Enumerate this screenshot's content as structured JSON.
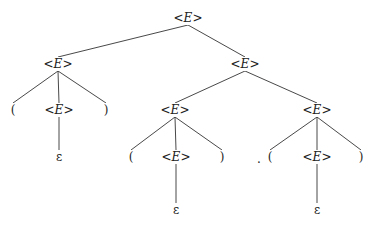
{
  "diagram": {
    "type": "parse-tree",
    "nodes": [
      {
        "id": "n0",
        "label": "<E>",
        "x": 188,
        "y": 18
      },
      {
        "id": "n1",
        "label": "<E>",
        "x": 58,
        "y": 64
      },
      {
        "id": "n2",
        "label": "<E>",
        "x": 245,
        "y": 64
      },
      {
        "id": "n3",
        "label": "(",
        "x": 13,
        "y": 110
      },
      {
        "id": "n4",
        "label": "<E>",
        "x": 59,
        "y": 110
      },
      {
        "id": "n5",
        "label": ")",
        "x": 106,
        "y": 110
      },
      {
        "id": "n6",
        "label": "ε",
        "x": 59,
        "y": 157
      },
      {
        "id": "n7",
        "label": "<E>",
        "x": 175,
        "y": 110
      },
      {
        "id": "n8",
        "label": "<E>",
        "x": 317,
        "y": 110
      },
      {
        "id": "n9",
        "label": "(",
        "x": 131,
        "y": 157
      },
      {
        "id": "n10",
        "label": "<E>",
        "x": 176,
        "y": 157
      },
      {
        "id": "n11",
        "label": ")",
        "x": 222,
        "y": 157
      },
      {
        "id": "n12",
        "label": "ε",
        "x": 176,
        "y": 210
      },
      {
        "id": "n13",
        "label": "(",
        "x": 270,
        "y": 157
      },
      {
        "id": "n14",
        "label": "<E>",
        "x": 317,
        "y": 157
      },
      {
        "id": "n15",
        "label": ")",
        "x": 361,
        "y": 157
      },
      {
        "id": "n16",
        "label": "ε",
        "x": 317,
        "y": 210
      },
      {
        "id": "n17",
        "label": ".",
        "x": 259,
        "y": 159
      }
    ],
    "edges": [
      [
        "n0",
        "n1"
      ],
      [
        "n0",
        "n2"
      ],
      [
        "n1",
        "n3"
      ],
      [
        "n1",
        "n4"
      ],
      [
        "n1",
        "n5"
      ],
      [
        "n4",
        "n6"
      ],
      [
        "n2",
        "n7"
      ],
      [
        "n2",
        "n8"
      ],
      [
        "n7",
        "n9"
      ],
      [
        "n7",
        "n10"
      ],
      [
        "n7",
        "n11"
      ],
      [
        "n10",
        "n12"
      ],
      [
        "n8",
        "n13"
      ],
      [
        "n8",
        "n14"
      ],
      [
        "n8",
        "n15"
      ],
      [
        "n14",
        "n16"
      ]
    ]
  }
}
